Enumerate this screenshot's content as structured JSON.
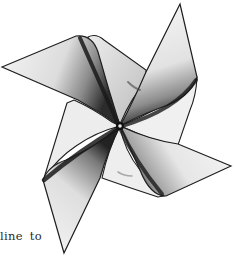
{
  "figure": {
    "style": "pencil shaded sketch",
    "blades": 4,
    "colors": {
      "outline": "#1e1e1e",
      "paper_light": "#f4f4f4",
      "paper_mid": "#c8c8c8",
      "shadow": "#2b2b2b",
      "background": "#ffffff"
    }
  },
  "caption": {
    "text": "line to"
  }
}
